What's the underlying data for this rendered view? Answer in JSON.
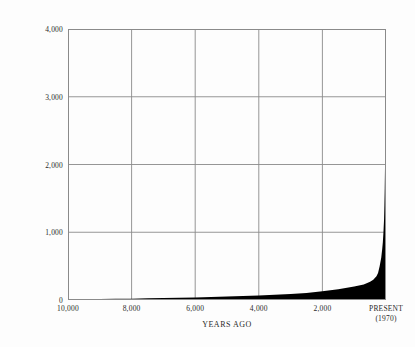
{
  "chart_data": {
    "type": "area",
    "title": "",
    "xlabel": "YEARS  AGO",
    "ylabel": "POPULATION (MILLIONS)",
    "x_tick_labels": [
      "10,000",
      "8,000",
      "6,000",
      "4,000",
      "2,000",
      "PRESENT",
      "(1970)"
    ],
    "x_ticks": [
      10000,
      8000,
      6000,
      4000,
      2000,
      0
    ],
    "y_tick_labels": [
      "4,000",
      "3,000",
      "2,000",
      "1,000",
      "0"
    ],
    "y_ticks": [
      4000,
      3000,
      2000,
      1000,
      0
    ],
    "xlim": [
      10000,
      0
    ],
    "ylim": [
      0,
      4000
    ],
    "grid": true,
    "legend": "none",
    "fill_color": "#000000",
    "axis_color": "#8a8a8a",
    "background": "#fdfdfd",
    "x": [
      10000,
      9500,
      9000,
      8500,
      8000,
      7500,
      7000,
      6500,
      6000,
      5500,
      5000,
      4500,
      4000,
      3500,
      3000,
      2500,
      2000,
      1500,
      1000,
      700,
      500,
      400,
      300,
      250,
      200,
      150,
      120,
      100,
      80,
      60,
      50,
      40,
      30,
      20,
      10,
      0
    ],
    "values": [
      10,
      12,
      14,
      17,
      20,
      24,
      28,
      33,
      38,
      44,
      50,
      58,
      67,
      78,
      90,
      105,
      130,
      160,
      200,
      230,
      270,
      300,
      350,
      400,
      500,
      625,
      750,
      850,
      1000,
      1200,
      1400,
      1650,
      2000,
      2400,
      3000,
      3700
    ],
    "series_name": "World population",
    "peak_value": 3700,
    "peak_label": "PRESENT (1970)"
  },
  "figure": {
    "xlabel": "YEARS  AGO",
    "ylabel": "POPULATION (MILLIONS)"
  }
}
